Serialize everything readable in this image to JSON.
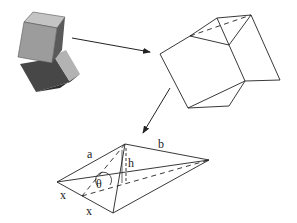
{
  "figure": {
    "labels": {
      "a": "a",
      "b": "b",
      "h": "h",
      "theta": "θ",
      "x1": "x",
      "x2": "x"
    },
    "colors": {
      "line": "#222222",
      "cube_top_light": "#bdbdbd",
      "cube_front": "#9a9a9a",
      "cube_side": "#5e5e5e",
      "cube2_dark": "#4a4a4a",
      "cube2_light": "#b5b5b5"
    }
  }
}
